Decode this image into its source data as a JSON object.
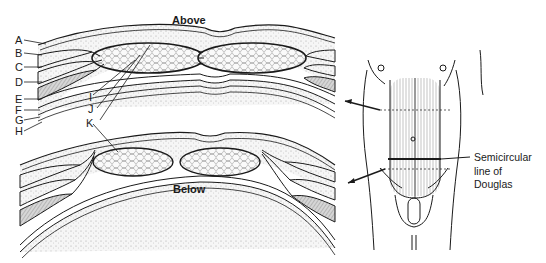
{
  "diagram": {
    "sections": {
      "above": {
        "title": "Above"
      },
      "below": {
        "title": "Below"
      }
    },
    "labels": [
      {
        "id": "A",
        "text": "A"
      },
      {
        "id": "B",
        "text": "B"
      },
      {
        "id": "C",
        "text": "C"
      },
      {
        "id": "D",
        "text": "D"
      },
      {
        "id": "E",
        "text": "E"
      },
      {
        "id": "F",
        "text": "F"
      },
      {
        "id": "G",
        "text": "G"
      },
      {
        "id": "H",
        "text": "H"
      },
      {
        "id": "I",
        "text": "I"
      },
      {
        "id": "J",
        "text": "J"
      },
      {
        "id": "K",
        "text": "K"
      }
    ],
    "torso": {
      "annotation": {
        "line1": "Semicircular",
        "line2": "line of",
        "line3": "Douglas"
      }
    },
    "colors": {
      "line": "#1a1a1a",
      "fill_fat": "#f4f4f4",
      "fill_muscle": "#cfcfcf",
      "background": "#ffffff"
    }
  }
}
